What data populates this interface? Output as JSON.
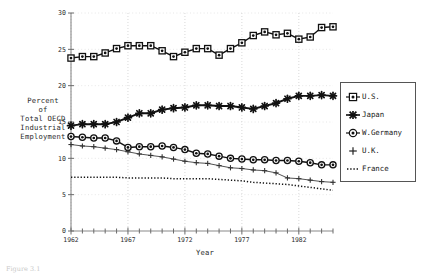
{
  "chart_data": {
    "type": "line",
    "title": "",
    "xlabel": "Year",
    "ylabel": "Percent of Total OECD Industrial Employment",
    "ylabel_lines": [
      "Percent",
      "of",
      "Total OECD",
      "Industrial",
      "Employment"
    ],
    "xlim": [
      1962,
      1985
    ],
    "ylim": [
      0,
      30
    ],
    "yticks": [
      0,
      5,
      10,
      15,
      20,
      25,
      30
    ],
    "ytick_labels": [
      "0",
      "5",
      "10",
      "15",
      "20",
      "25",
      "30"
    ],
    "xticks": [
      1962,
      1967,
      1972,
      1977,
      1982
    ],
    "xtick_labels": [
      "1962",
      "1967",
      "1972",
      "1977",
      "1982"
    ],
    "xminor_step": 1,
    "grid": true,
    "legend_position": "right",
    "x": [
      1962,
      1963,
      1964,
      1965,
      1966,
      1967,
      1968,
      1969,
      1970,
      1971,
      1972,
      1973,
      1974,
      1975,
      1976,
      1977,
      1978,
      1979,
      1980,
      1981,
      1982,
      1983,
      1984,
      1985
    ],
    "series": [
      {
        "name": "U.S.",
        "marker": "square-dot",
        "style": "solid",
        "color": "#111111",
        "values": [
          23.8,
          24.0,
          24.0,
          24.5,
          25.1,
          25.5,
          25.5,
          25.5,
          24.8,
          24.0,
          24.6,
          25.1,
          25.1,
          24.2,
          25.1,
          25.9,
          26.9,
          27.4,
          27.0,
          27.2,
          26.4,
          26.7,
          28.0,
          28.1
        ]
      },
      {
        "name": "Japan",
        "marker": "star",
        "style": "solid",
        "color": "#111111",
        "values": [
          14.5,
          14.7,
          14.7,
          14.7,
          15.0,
          15.6,
          16.2,
          16.2,
          16.7,
          16.9,
          17.0,
          17.3,
          17.3,
          17.2,
          17.2,
          17.0,
          16.8,
          17.2,
          17.6,
          18.2,
          18.6,
          18.6,
          18.7,
          18.6
        ]
      },
      {
        "name": "W.Germany",
        "marker": "circle-dot",
        "style": "solid",
        "color": "#111111",
        "values": [
          13.0,
          12.9,
          12.8,
          12.8,
          12.4,
          11.5,
          11.6,
          11.6,
          11.7,
          11.5,
          11.2,
          10.7,
          10.6,
          10.3,
          10.0,
          9.9,
          9.8,
          9.8,
          9.7,
          9.7,
          9.6,
          9.4,
          9.1,
          9.1
        ]
      },
      {
        "name": "U.K.",
        "marker": "plus",
        "style": "solid-thin",
        "color": "#333333",
        "values": [
          11.9,
          11.7,
          11.6,
          11.4,
          11.2,
          10.9,
          10.6,
          10.4,
          10.2,
          9.9,
          9.6,
          9.4,
          9.3,
          9.0,
          8.7,
          8.6,
          8.4,
          8.3,
          8.0,
          7.3,
          7.2,
          7.0,
          6.8,
          6.7
        ]
      },
      {
        "name": "France",
        "marker": "none",
        "style": "dotted",
        "color": "#111111",
        "values": [
          7.4,
          7.4,
          7.4,
          7.4,
          7.4,
          7.3,
          7.3,
          7.3,
          7.3,
          7.2,
          7.2,
          7.2,
          7.2,
          7.1,
          7.0,
          6.9,
          6.7,
          6.6,
          6.5,
          6.4,
          6.2,
          6.0,
          5.8,
          5.6
        ]
      }
    ]
  },
  "legend": {
    "items": [
      {
        "label": "U.S."
      },
      {
        "label": "Japan"
      },
      {
        "label": "W.Germany"
      },
      {
        "label": "U.K."
      },
      {
        "label": "France"
      }
    ]
  },
  "caption": "Figure 3.1"
}
